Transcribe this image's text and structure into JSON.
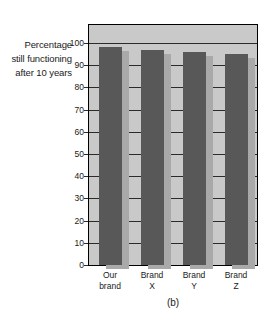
{
  "chart_data": {
    "type": "bar",
    "title": "",
    "caption": "(b)",
    "xlabel": "",
    "ylabel": "Percentage still functioning after 10 years",
    "ylabel_lines": [
      "Percentage",
      "still functioning",
      "after 10 years"
    ],
    "categories": [
      "Our brand",
      "Brand X",
      "Brand Y",
      "Brand Z"
    ],
    "category_lines": [
      [
        "Our",
        "brand"
      ],
      [
        "Brand",
        "X"
      ],
      [
        "Brand",
        "Y"
      ],
      [
        "Brand",
        "Z"
      ]
    ],
    "values": [
      98,
      97,
      96,
      95
    ],
    "ylim": [
      0,
      100
    ],
    "ytick_labels": [
      "0",
      "10",
      "20",
      "30",
      "40",
      "50",
      "60",
      "70",
      "80",
      "90",
      "100"
    ],
    "ytick_values": [
      0,
      10,
      20,
      30,
      40,
      50,
      60,
      70,
      80,
      90,
      100
    ],
    "grid": true,
    "legend": "none",
    "colors": {
      "bar": "#585858",
      "bar_shadow": "#a9a9a9",
      "plot_background": "#c9c9c9",
      "gridline": "#2b2b2b",
      "axis": "#000000",
      "text": "#1a1a1a",
      "page_background": "#ffffff"
    }
  }
}
